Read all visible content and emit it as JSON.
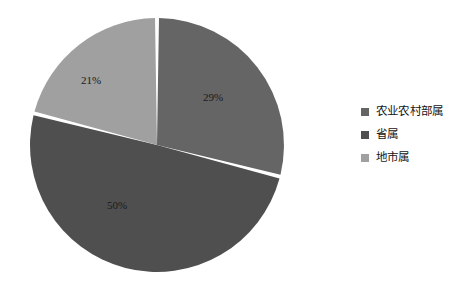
{
  "chart_data": {
    "type": "pie",
    "title": "",
    "categories": [
      "农业农村部属",
      "省属",
      "地市属"
    ],
    "values": [
      29,
      50,
      21
    ],
    "value_labels": [
      "29%",
      "50%",
      "21%"
    ],
    "colors": [
      "#656565",
      "#4f4f4f",
      "#a0a0a0"
    ],
    "legend_position": "right",
    "grid": false,
    "start_angle_deg": 0,
    "direction": "clockwise",
    "slice_gap_color": "#ffffff",
    "background": "#ffffff",
    "label_color": "#1a1a1a"
  },
  "pie": {
    "center_x": 157,
    "center_y": 145,
    "radius": 127,
    "slices": [
      {
        "name": "农业农村部属",
        "percent_label": "29%",
        "value": 29,
        "color": "#656565",
        "label_x": 213,
        "label_y": 98
      },
      {
        "name": "省属",
        "percent_label": "50%",
        "value": 50,
        "color": "#4f4f4f",
        "label_x": 117,
        "label_y": 206
      },
      {
        "name": "地市属",
        "percent_label": "21%",
        "value": 21,
        "color": "#a0a0a0",
        "label_x": 91,
        "label_y": 81
      }
    ]
  },
  "legend": {
    "items": [
      {
        "label": "农业农村部属",
        "color": "#656565"
      },
      {
        "label": "省属",
        "color": "#4f4f4f"
      },
      {
        "label": "地市属",
        "color": "#a0a0a0"
      }
    ]
  }
}
